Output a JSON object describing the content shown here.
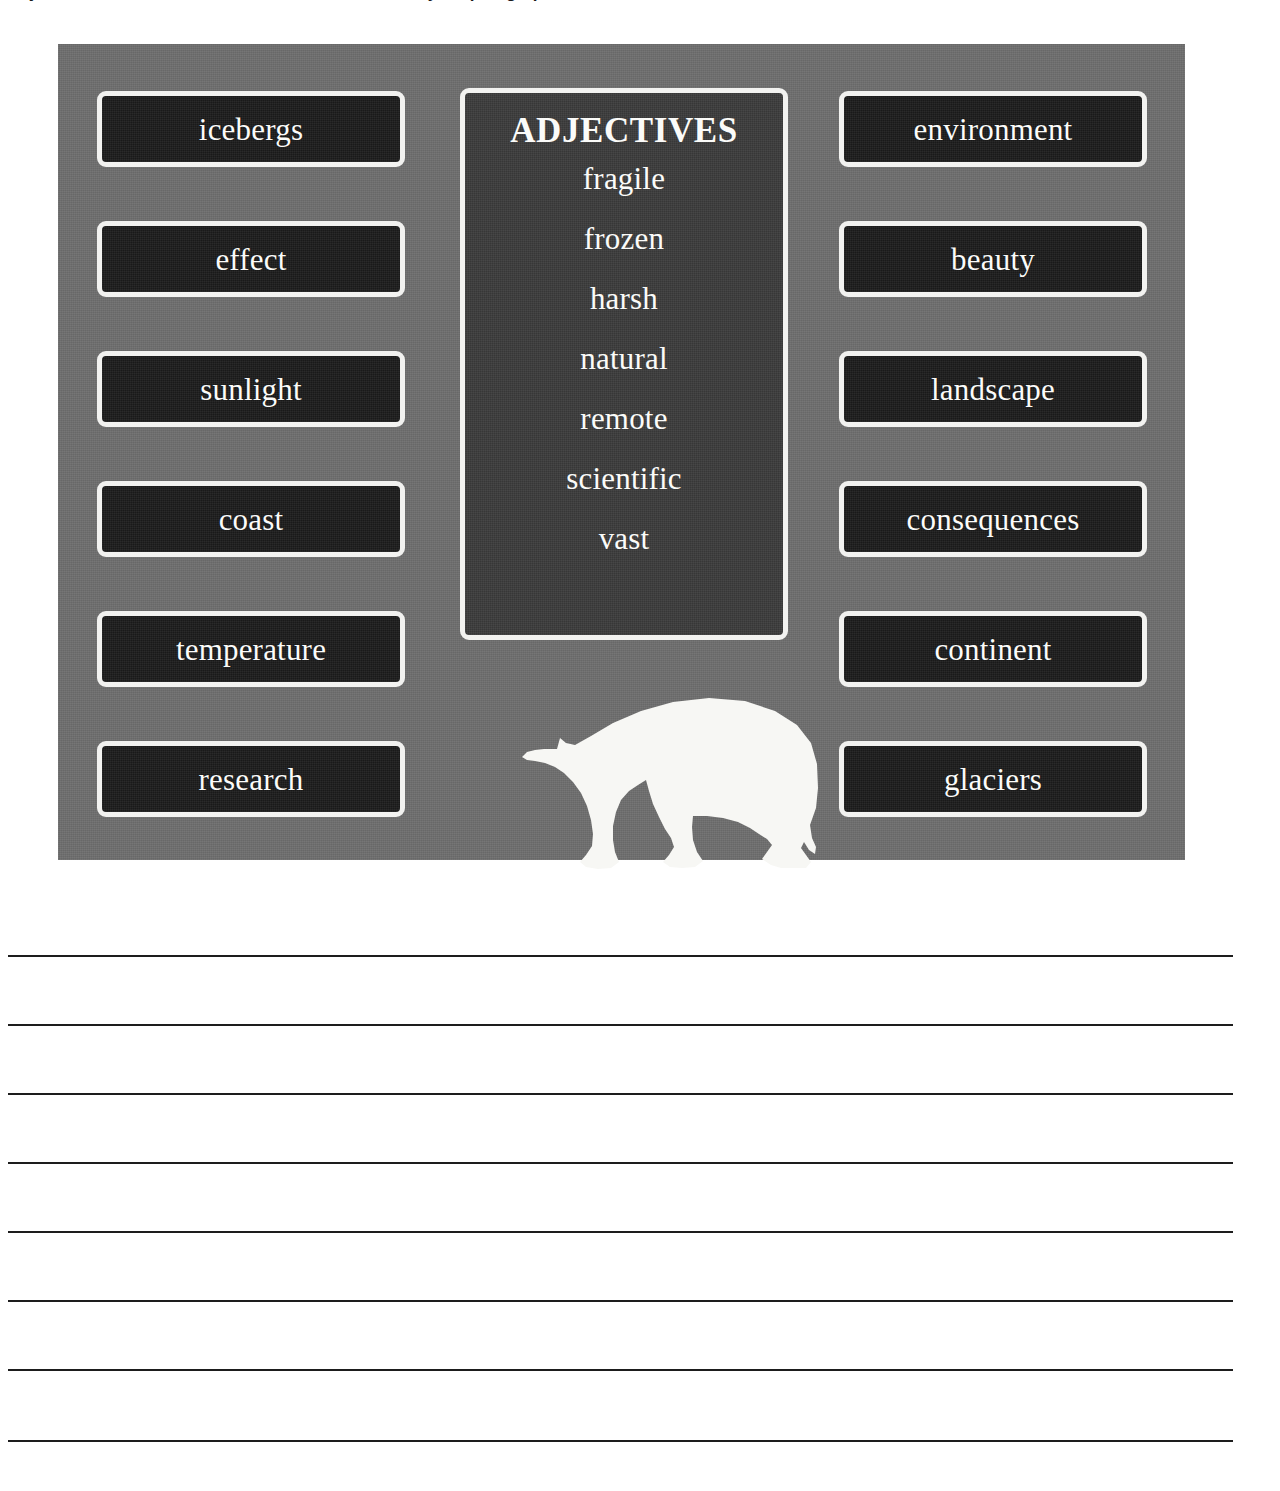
{
  "page": {
    "clipped_instruction_top": "adjectives and nouns from the word bank below in your paragraph about Antarctica and its wildlife",
    "background_color": "#ffffff"
  },
  "poster": {
    "background_color": "#6e6e6e",
    "box_fill_color": "#1b1b1b",
    "box_border_color": "#f2f2f0",
    "panel_fill_color": "#3b3b3b",
    "text_color": "#fbfbf9",
    "left_column": [
      {
        "label": "icebergs"
      },
      {
        "label": "effect"
      },
      {
        "label": "sunlight"
      },
      {
        "label": "coast"
      },
      {
        "label": "temperature"
      },
      {
        "label": "research"
      }
    ],
    "right_column": [
      {
        "label": "environment"
      },
      {
        "label": "beauty"
      },
      {
        "label": "landscape"
      },
      {
        "label": "consequences"
      },
      {
        "label": "continent"
      },
      {
        "label": "glaciers"
      }
    ],
    "adjectives_panel": {
      "title": "ADJECTIVES",
      "words": [
        "fragile",
        "frozen",
        "harsh",
        "natural",
        "remote",
        "scientific",
        "vast"
      ]
    },
    "illustration": {
      "name": "polar-bear-silhouette",
      "color": "#f7f7f4",
      "facing": "left"
    }
  },
  "writing_area": {
    "line_count": 8,
    "line_color": "#1d1d1d",
    "line_positions_y": [
      95,
      164,
      233,
      302,
      371,
      440,
      509,
      580
    ]
  }
}
